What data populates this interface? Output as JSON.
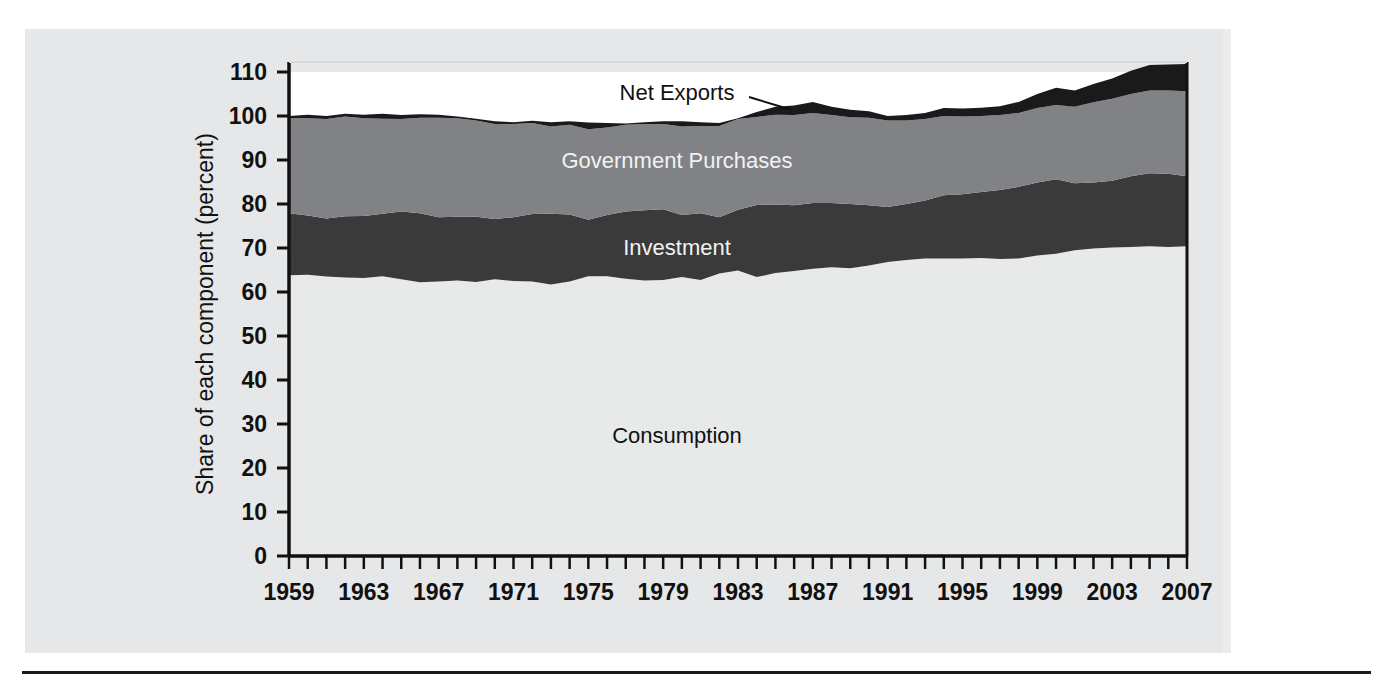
{
  "figure": {
    "clipped_top_text": "",
    "background_color": "#e6e7e8",
    "plot_background_color": "#ffffff",
    "rule_color": "#1a1a1a"
  },
  "chart_data": {
    "type": "area",
    "title": "",
    "xlabel": "",
    "ylabel": "Share of each component (percent)",
    "ylim": [
      0,
      110
    ],
    "xlim": [
      1959,
      2007
    ],
    "grid": false,
    "legend_position": "inline-labels",
    "y_ticks": [
      0,
      10,
      20,
      30,
      40,
      50,
      60,
      70,
      80,
      90,
      100,
      110
    ],
    "y_tick_labels": [
      "0",
      "10",
      "20",
      "30",
      "40",
      "50",
      "60",
      "70",
      "80",
      "90",
      "100",
      "110"
    ],
    "x_tick_labels": [
      "1959",
      "1963",
      "1967",
      "1971",
      "1975",
      "1979",
      "1983",
      "1987",
      "1991",
      "1995",
      "1999",
      "2003",
      "2007"
    ],
    "x_tick_label_step": 4,
    "x_minor_tick_step": 1,
    "x": [
      1959,
      1960,
      1961,
      1962,
      1963,
      1964,
      1965,
      1966,
      1967,
      1968,
      1969,
      1970,
      1971,
      1972,
      1973,
      1974,
      1975,
      1976,
      1977,
      1978,
      1979,
      1980,
      1981,
      1982,
      1983,
      1984,
      1985,
      1986,
      1987,
      1988,
      1989,
      1990,
      1991,
      1992,
      1993,
      1994,
      1995,
      1996,
      1997,
      1998,
      1999,
      2000,
      2001,
      2002,
      2003,
      2004,
      2005,
      2006,
      2007
    ],
    "colors": {
      "consumption": "#e8e9e9",
      "investment": "#3a3a3a",
      "government_purchases": "#818285",
      "net_exports": "#1a1a1a",
      "above_plot": "#ffffff"
    },
    "series": [
      {
        "name": "Consumption",
        "color": "#e8e9e9",
        "label_color": "#111111",
        "values": [
          63.8,
          63.9,
          63.5,
          63.3,
          63.2,
          63.6,
          62.9,
          62.2,
          62.4,
          62.6,
          62.3,
          62.9,
          62.5,
          62.4,
          61.7,
          62.4,
          63.6,
          63.6,
          63.0,
          62.6,
          62.7,
          63.4,
          62.7,
          64.2,
          64.9,
          63.4,
          64.3,
          64.8,
          65.3,
          65.6,
          65.4,
          66.0,
          66.8,
          67.3,
          67.6,
          67.6,
          67.6,
          67.7,
          67.5,
          67.6,
          68.3,
          68.7,
          69.5,
          69.9,
          70.1,
          70.2,
          70.4,
          70.2,
          70.4
        ]
      },
      {
        "name": "Investment",
        "color": "#3a3a3a",
        "label_color": "#f2f2f2",
        "values": [
          14.1,
          13.5,
          13.2,
          13.9,
          14.1,
          14.2,
          15.4,
          15.7,
          14.6,
          14.5,
          14.8,
          13.7,
          14.5,
          15.3,
          16.1,
          15.2,
          12.8,
          13.9,
          15.3,
          16.0,
          16.1,
          14.1,
          15.2,
          12.8,
          13.8,
          16.4,
          15.6,
          14.9,
          14.9,
          14.6,
          14.6,
          13.7,
          12.5,
          12.7,
          13.2,
          14.4,
          14.6,
          15.0,
          15.7,
          16.3,
          16.6,
          16.9,
          15.2,
          15.0,
          15.2,
          16.1,
          16.6,
          16.7,
          15.9
        ]
      },
      {
        "name": "Government Purchases",
        "color": "#818285",
        "label_color": "#f2f2f2",
        "values": [
          21.6,
          22.1,
          22.6,
          22.7,
          22.2,
          21.6,
          21.0,
          21.7,
          22.6,
          22.4,
          21.9,
          21.6,
          21.2,
          20.7,
          19.8,
          20.4,
          20.6,
          19.9,
          19.7,
          19.6,
          19.4,
          20.1,
          19.8,
          20.7,
          20.6,
          20.0,
          20.4,
          20.5,
          20.5,
          20.0,
          19.7,
          19.9,
          19.7,
          19.0,
          18.5,
          18.0,
          17.7,
          17.3,
          17.0,
          16.8,
          16.9,
          16.9,
          17.4,
          18.2,
          18.6,
          18.7,
          18.8,
          18.9,
          19.3
        ]
      },
      {
        "name": "Net Exports",
        "color": "#1a1a1a",
        "label_color": "#111111",
        "values": [
          0.5,
          0.8,
          0.7,
          0.6,
          0.8,
          1.1,
          0.9,
          0.8,
          0.7,
          0.4,
          0.4,
          0.6,
          0.4,
          0.5,
          1.0,
          0.8,
          1.5,
          1.0,
          0.3,
          0.4,
          0.6,
          1.2,
          0.9,
          0.7,
          0.2,
          1.1,
          1.8,
          2.2,
          2.5,
          1.9,
          1.7,
          1.5,
          1.0,
          1.2,
          1.4,
          1.8,
          1.8,
          1.9,
          2.0,
          2.5,
          3.2,
          3.9,
          3.7,
          4.2,
          4.6,
          5.3,
          5.8,
          5.9,
          6.2
        ]
      }
    ],
    "annotations": [
      {
        "text": "Net Exports",
        "x_px": 677,
        "y_px": 100,
        "anchor": "middle",
        "color": "#111111",
        "leader_line": {
          "x1": 749,
          "y1": 97,
          "x2": 792,
          "y2": 110
        }
      },
      {
        "text": "Government Purchases",
        "x_px": 677,
        "y_px": 168,
        "anchor": "middle",
        "color": "#f2f2f2"
      },
      {
        "text": "Investment",
        "x_px": 677,
        "y_px": 255,
        "anchor": "middle",
        "color": "#f2f2f2"
      },
      {
        "text": "Consumption",
        "x_px": 677,
        "y_px": 443,
        "anchor": "middle",
        "color": "#111111"
      }
    ]
  }
}
